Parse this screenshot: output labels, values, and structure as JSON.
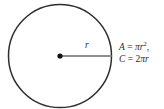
{
  "figure": {
    "kind": "circle-geometry-diagram",
    "background_color": "#ffffff",
    "width": 164,
    "height": 109
  },
  "circle": {
    "stroke_color": "#2e2e2e",
    "stroke_width": 1.5,
    "fill": "none",
    "center_x": 60,
    "center_y": 56,
    "radius": 51.5
  },
  "center_point": {
    "label": "center-dot",
    "color": "#111111",
    "radius": 2.6
  },
  "radius_segment": {
    "color": "#8d8d8d",
    "stroke_width": 2,
    "from_x": 60,
    "from_y": 56,
    "to_x": 111.5,
    "to_y": 56
  },
  "labels": {
    "radius": "r"
  },
  "formulas": {
    "area": {
      "lhs": "A",
      "equals": " = ",
      "pi": "π",
      "variable": "r",
      "exponent": "2",
      "trailing": ","
    },
    "circumference": {
      "lhs": "C",
      "equals": " = ",
      "coefficient": "2",
      "pi": "π",
      "variable": "r"
    },
    "plain_text": {
      "area": "A = πr²,",
      "circumference": "C = 2πr"
    }
  }
}
